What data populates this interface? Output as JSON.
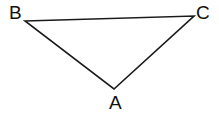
{
  "figure": {
    "kind": "geometry-diagram",
    "shape": "triangle",
    "width": 219,
    "height": 114,
    "background_color": "#ffffff",
    "stroke_color": "#1a1a1a",
    "stroke_width": 1.6,
    "label_color": "#111111",
    "label_font_size": 19,
    "vertices": [
      {
        "name": "A",
        "label": "A",
        "x": 114,
        "y": 89,
        "label_x": 109,
        "label_y": 93
      },
      {
        "name": "B",
        "label": "B",
        "x": 25,
        "y": 21,
        "label_x": 9,
        "label_y": 3
      },
      {
        "name": "C",
        "label": "C",
        "x": 194,
        "y": 16,
        "label_x": 196,
        "label_y": 3
      }
    ],
    "edges": [
      {
        "name": "BC",
        "from": "B",
        "to": "C"
      },
      {
        "name": "BA",
        "from": "B",
        "to": "A"
      },
      {
        "name": "AC",
        "from": "A",
        "to": "C"
      }
    ],
    "polygon_points": "25,21 194,16 114,89"
  }
}
